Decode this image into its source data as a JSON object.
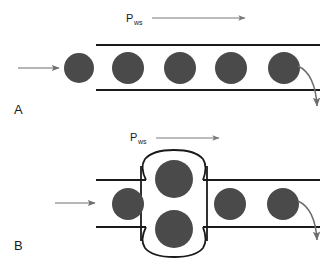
{
  "figure": {
    "title": "",
    "background_color": "#ffffff",
    "width": 330,
    "height": 264,
    "colors": {
      "cell_fill": "#4a4a4a",
      "vessel_wall": "#1a1a1a",
      "flow_arrow": "#6e6e6e",
      "pressure_arrow": "#7a7a7a",
      "text": "#1a1a1a"
    }
  },
  "panels": [
    {
      "id": "panel-a",
      "letter": "A",
      "letter_x": 14,
      "letter_y": 114,
      "pressure_label": {
        "symbol": "P",
        "subscript": "ws",
        "x": 126,
        "y": 22,
        "arrow": {
          "x1": 152,
          "y1": 18,
          "x2": 248,
          "y2": 18
        }
      },
      "inlet_arrow": {
        "x1": 18,
        "y1": 68,
        "x2": 62,
        "y2": 68
      },
      "outlet_arrow": {
        "start_x": 298,
        "start_y": 66,
        "end_x": 318,
        "end_y": 112
      },
      "vessel": {
        "shape": "straight-tube",
        "x_left": 96,
        "x_right": 320,
        "y_top": 45,
        "y_bottom": 90,
        "wall_thickness": 2
      },
      "cells": [
        {
          "cx": 79,
          "cy": 68,
          "r": 15,
          "location": "outside-inlet"
        },
        {
          "cx": 128,
          "cy": 68,
          "r": 16,
          "location": "inside-tube"
        },
        {
          "cx": 180,
          "cy": 68,
          "r": 16,
          "location": "inside-tube"
        },
        {
          "cx": 231,
          "cy": 68,
          "r": 16,
          "location": "inside-tube"
        },
        {
          "cx": 284,
          "cy": 68,
          "r": 16,
          "location": "inside-tube"
        }
      ]
    },
    {
      "id": "panel-b",
      "letter": "B",
      "letter_x": 14,
      "letter_y": 250,
      "pressure_label": {
        "symbol": "P",
        "subscript": "ws",
        "x": 130,
        "y": 141,
        "arrow": {
          "x1": 156,
          "y1": 138,
          "x2": 222,
          "y2": 138
        }
      },
      "inlet_arrow": {
        "x1": 55,
        "y1": 203,
        "x2": 98,
        "y2": 203
      },
      "outlet_arrow": {
        "start_x": 298,
        "start_y": 201,
        "end_x": 317,
        "end_y": 246
      },
      "vessel": {
        "shape": "tube-with-aneurysm-bulge",
        "x_left": 96,
        "x_right": 320,
        "y_top": 180,
        "y_bottom": 227,
        "wall_thickness": 2,
        "bulge": {
          "cx": 174,
          "cy": 204,
          "half_width": 33,
          "half_height": 52,
          "description": "vertically elongated stadium-shaped dilation"
        }
      },
      "cells": [
        {
          "cx": 128,
          "cy": 204,
          "r": 16,
          "location": "inside-tube"
        },
        {
          "cx": 174,
          "cy": 179,
          "r": 19,
          "location": "inside-bulge-upper"
        },
        {
          "cx": 174,
          "cy": 229,
          "r": 19,
          "location": "inside-bulge-lower"
        },
        {
          "cx": 230,
          "cy": 204,
          "r": 16,
          "location": "inside-tube"
        },
        {
          "cx": 283,
          "cy": 204,
          "r": 16,
          "location": "inside-tube"
        }
      ]
    }
  ]
}
